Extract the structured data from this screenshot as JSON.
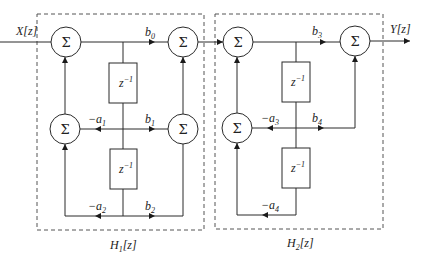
{
  "diagram": {
    "type": "cascaded second-order IIR filter block diagram",
    "input_label": "X[z]",
    "output_label": "Y[z]",
    "adder_symbol": "Σ",
    "delay_label": "z",
    "delay_exponent": "−1",
    "sections": [
      {
        "name": "H",
        "index": "1",
        "suffix": "[z]",
        "coefficients": {
          "b0": {
            "base": "b",
            "sub": "0"
          },
          "b1": {
            "base": "b",
            "sub": "1"
          },
          "b2": {
            "base": "b",
            "sub": "2"
          },
          "a1": {
            "base": "−a",
            "sub": "1"
          },
          "a2": {
            "base": "−a",
            "sub": "2"
          }
        }
      },
      {
        "name": "H",
        "index": "2",
        "suffix": "[z]",
        "coefficients": {
          "b3": {
            "base": "b",
            "sub": "3"
          },
          "b4": {
            "base": "b",
            "sub": "4"
          },
          "a3": {
            "base": "−a",
            "sub": "3"
          },
          "a4": {
            "base": "−a",
            "sub": "4"
          }
        }
      }
    ]
  }
}
